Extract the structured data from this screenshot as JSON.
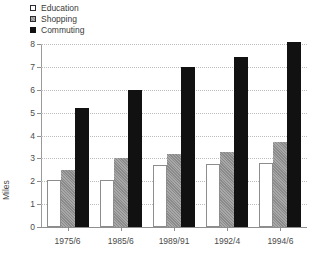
{
  "chart_data": {
    "type": "bar",
    "title": "",
    "xlabel": "",
    "ylabel": "Miles",
    "ylim": [
      0,
      8
    ],
    "ytick_labels": [
      "0",
      "1",
      "2",
      "3",
      "4",
      "5",
      "6",
      "7",
      "8"
    ],
    "yticks": [
      0,
      1,
      2,
      3,
      4,
      5,
      6,
      7,
      8
    ],
    "grid": true,
    "legend_position": "top-left",
    "categories": [
      "1975/6",
      "1985/6",
      "1989/91",
      "1992/4",
      "1994/6"
    ],
    "series": [
      {
        "name": "Education",
        "color": "#ffffff",
        "values": [
          2.05,
          2.05,
          2.7,
          2.75,
          2.8
        ]
      },
      {
        "name": "Shopping",
        "color": "#8a8a8a",
        "values": [
          2.5,
          3.0,
          3.2,
          3.3,
          3.7
        ]
      },
      {
        "name": "Commuting",
        "color": "#111111",
        "values": [
          5.2,
          6.0,
          7.0,
          7.45,
          8.1
        ]
      }
    ]
  }
}
